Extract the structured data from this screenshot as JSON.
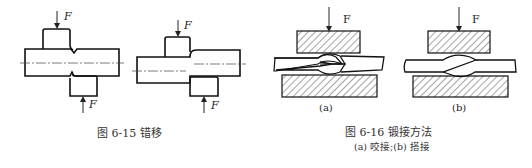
{
  "figure_6_15": {
    "caption": "图 6-15    错移",
    "force_label": "F",
    "left_drawing": {
      "force_top": "F",
      "force_bottom": "F"
    },
    "right_drawing": {
      "force_top": "F",
      "force_bottom": "F"
    }
  },
  "figure_6_16": {
    "caption": "图 6-16    锻接方法",
    "subcaption": "(a) 咬接;(b) 搭接",
    "panel_a": {
      "label": "(a)",
      "force": "F"
    },
    "panel_b": {
      "label": "(b)",
      "force": "F"
    }
  }
}
